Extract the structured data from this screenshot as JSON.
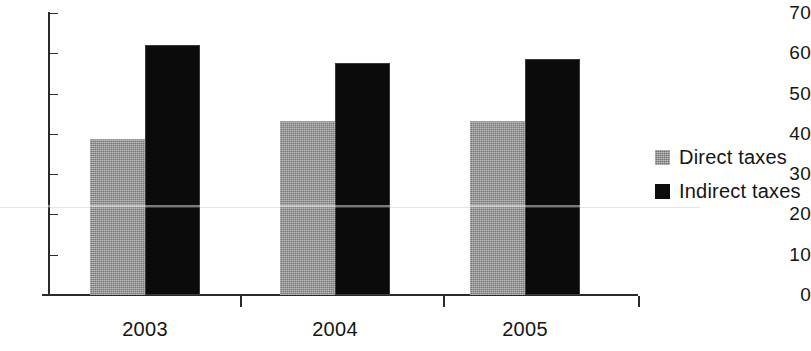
{
  "chart_data": {
    "type": "bar",
    "title": "",
    "subtitle": "",
    "xlabel": "",
    "ylabel": "",
    "categories": [
      "2003",
      "2004",
      "2005"
    ],
    "series": [
      {
        "name": "Direct taxes",
        "color": "#919191",
        "values": [
          38.5,
          43.0,
          43.0
        ]
      },
      {
        "name": "Indirect taxes",
        "color": "#0b0b0b",
        "values": [
          62.0,
          57.5,
          58.5
        ]
      }
    ],
    "ylim": [
      0,
      70
    ],
    "ytick_labels": [
      "0",
      "10",
      "20",
      "30",
      "40",
      "50",
      "60",
      "70"
    ],
    "ytick_values": [
      0,
      10,
      20,
      30,
      40,
      50,
      60,
      70
    ],
    "grid": false,
    "legend_position": "right"
  },
  "legend": {
    "entries": [
      {
        "label": "Direct taxes",
        "swatch": "gray-square-swatch"
      },
      {
        "label": "Indirect taxes",
        "swatch": "black-square-swatch"
      }
    ]
  }
}
